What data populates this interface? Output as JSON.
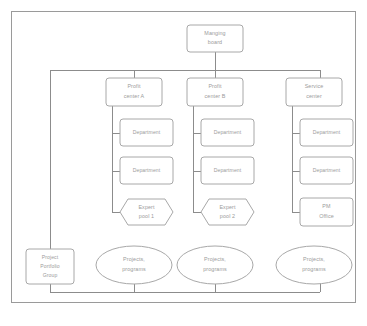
{
  "diagram": {
    "type": "organizational-chart",
    "colors": {
      "background": "#ffffff",
      "node_fill": "#ffffff",
      "node_stroke": "#a8a8a8",
      "connector": "#8c8c8c",
      "frame": "#9a9a9a",
      "label_text": "#9b9b9b"
    },
    "nodes": {
      "managing_board": {
        "label_line1": "Manging",
        "label_line2": "board",
        "shape": "rectangle"
      },
      "profit_center_a": {
        "label_line1": "Profit",
        "label_line2": "center A",
        "shape": "rectangle"
      },
      "profit_center_b": {
        "label_line1": "Profit",
        "label_line2": "center B",
        "shape": "rectangle"
      },
      "service_center": {
        "label_line1": "Service",
        "label_line2": "center",
        "shape": "rectangle"
      },
      "department_a1": {
        "label": "Department",
        "shape": "rectangle"
      },
      "department_a2": {
        "label": "Department",
        "shape": "rectangle"
      },
      "department_b1": {
        "label": "Department",
        "shape": "rectangle"
      },
      "department_b2": {
        "label": "Department",
        "shape": "rectangle"
      },
      "department_s1": {
        "label": "Department",
        "shape": "rectangle"
      },
      "department_s2": {
        "label": "Department",
        "shape": "rectangle"
      },
      "expert_pool_1": {
        "label_line1": "Expert",
        "label_line2": "pool 1",
        "shape": "hexagon"
      },
      "expert_pool_2": {
        "label_line1": "Expert",
        "label_line2": "pool 2",
        "shape": "hexagon"
      },
      "pm_office": {
        "label_line1": "PM",
        "label_line2": "Office",
        "shape": "rectangle"
      },
      "project_portfolio_group": {
        "label_line1": "Project",
        "label_line2": "Portfolio",
        "label_line3": "Group",
        "shape": "rectangle"
      },
      "projects_programs_a": {
        "label_line1": "Projects,",
        "label_line2": "programs",
        "shape": "ellipse"
      },
      "projects_programs_b": {
        "label_line1": "Projects,",
        "label_line2": "programs",
        "shape": "ellipse"
      },
      "projects_programs_s": {
        "label_line1": "Projects,",
        "label_line2": "programs",
        "shape": "ellipse"
      }
    }
  }
}
